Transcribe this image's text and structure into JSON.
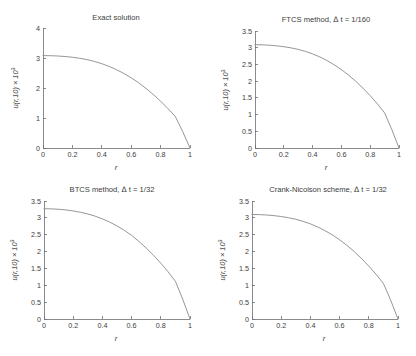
{
  "figure": {
    "background": "#ffffff",
    "axis_color": "#6e6e6e",
    "curve_color": "#8a8a8a",
    "text_color": "#3d3d3d"
  },
  "chart_data": [
    {
      "id": "exact",
      "type": "line",
      "title": "Exact solution",
      "xlabel": "r",
      "ylabel": "u(r,10) × 10³",
      "ylabel_main": "u(r,10) × 10",
      "ylabel_exp": "3",
      "xlim": [
        0,
        1
      ],
      "ylim": [
        0,
        4
      ],
      "xticks": [
        0,
        0.2,
        0.4,
        0.6,
        0.8,
        1
      ],
      "xticklabels": [
        "0",
        "0.2",
        "0.4",
        "0.6",
        "0.8",
        "1"
      ],
      "yticks": [
        0,
        1,
        2,
        3,
        4
      ],
      "yticklabels": [
        "0",
        "1",
        "2",
        "3",
        "4"
      ],
      "grid": false,
      "legend": false,
      "x": [
        0,
        0.05,
        0.1,
        0.15,
        0.2,
        0.25,
        0.3,
        0.35,
        0.4,
        0.45,
        0.5,
        0.55,
        0.6,
        0.65,
        0.7,
        0.75,
        0.8,
        0.85,
        0.9,
        0.95,
        1
      ],
      "y": [
        3.08,
        3.077,
        3.067,
        3.05,
        3.025,
        2.99,
        2.945,
        2.885,
        2.81,
        2.72,
        2.61,
        2.485,
        2.34,
        2.175,
        1.99,
        1.785,
        1.56,
        1.315,
        1.05,
        0.55,
        0
      ]
    },
    {
      "id": "ftcs",
      "type": "line",
      "title": "FTCS method, Δ t = 1/160",
      "title_prefix": "FTCS method, ",
      "title_delta": "Δ",
      "title_suffix": " t = 1/160",
      "xlabel": "r",
      "ylabel": "u(r,10) × 10³",
      "ylabel_main": "u(r,10) × 10",
      "ylabel_exp": "3",
      "xlim": [
        0,
        1
      ],
      "ylim": [
        0,
        3.5
      ],
      "xticks": [
        0,
        0.2,
        0.4,
        0.6,
        0.8,
        1
      ],
      "xticklabels": [
        "0",
        "0.2",
        "0.4",
        "0.6",
        "0.8",
        "1"
      ],
      "yticks": [
        0,
        0.5,
        1,
        1.5,
        2,
        2.5,
        3,
        3.5
      ],
      "yticklabels": [
        "0",
        "0.5",
        "1",
        "1.5",
        "2",
        "2.5",
        "3",
        "3.5"
      ],
      "grid": false,
      "legend": false,
      "x": [
        0,
        0.05,
        0.1,
        0.15,
        0.2,
        0.25,
        0.3,
        0.35,
        0.4,
        0.45,
        0.5,
        0.55,
        0.6,
        0.65,
        0.7,
        0.75,
        0.8,
        0.85,
        0.9,
        0.95,
        1
      ],
      "y": [
        3.09,
        3.086,
        3.075,
        3.057,
        3.03,
        2.995,
        2.95,
        2.89,
        2.815,
        2.725,
        2.615,
        2.49,
        2.345,
        2.18,
        1.995,
        1.79,
        1.565,
        1.32,
        1.05,
        0.55,
        0
      ]
    },
    {
      "id": "btcs",
      "type": "line",
      "title": "BTCS method,  Δ t = 1/32",
      "title_prefix": "BTCS method,  ",
      "title_delta": "Δ",
      "title_suffix": " t = 1/32",
      "xlabel": "r",
      "ylabel": "u(r,10) × 10³",
      "ylabel_main": "u(r,10) × 10",
      "ylabel_exp": "3",
      "xlim": [
        0,
        1
      ],
      "ylim": [
        0,
        3.5
      ],
      "xticks": [
        0,
        0.2,
        0.4,
        0.6,
        0.8,
        1
      ],
      "xticklabels": [
        "0",
        "0.2",
        "0.4",
        "0.6",
        "0.8",
        "1"
      ],
      "yticks": [
        0,
        0.5,
        1,
        1.5,
        2,
        2.5,
        3,
        3.5
      ],
      "yticklabels": [
        "0",
        "0.5",
        "1",
        "1.5",
        "2",
        "2.5",
        "3",
        "3.5"
      ],
      "grid": false,
      "legend": false,
      "x": [
        0,
        0.05,
        0.1,
        0.15,
        0.2,
        0.25,
        0.3,
        0.35,
        0.4,
        0.45,
        0.5,
        0.55,
        0.6,
        0.65,
        0.7,
        0.75,
        0.8,
        0.85,
        0.9,
        0.95,
        1
      ],
      "y": [
        3.27,
        3.266,
        3.255,
        3.235,
        3.205,
        3.165,
        3.115,
        3.05,
        2.97,
        2.875,
        2.76,
        2.63,
        2.48,
        2.3,
        2.105,
        1.89,
        1.655,
        1.4,
        1.12,
        0.59,
        0
      ]
    },
    {
      "id": "crank-nicolson",
      "type": "line",
      "title": "Crank-Nicolson scheme,  Δ t = 1/32",
      "title_prefix": "Crank-Nicolson scheme,  ",
      "title_delta": "Δ",
      "title_suffix": " t = 1/32",
      "xlabel": "r",
      "ylabel": "u(r,10) × 10³",
      "ylabel_main": "u(r,10) × 10",
      "ylabel_exp": "3",
      "xlim": [
        0,
        1
      ],
      "ylim": [
        0,
        3.5
      ],
      "xticks": [
        0,
        0.2,
        0.4,
        0.6,
        0.8,
        1
      ],
      "xticklabels": [
        "0",
        "0.2",
        "0.4",
        "0.6",
        "0.8",
        "1"
      ],
      "yticks": [
        0,
        0.5,
        1,
        1.5,
        2,
        2.5,
        3,
        3.5
      ],
      "yticklabels": [
        "0",
        "0.5",
        "1",
        "1.5",
        "2",
        "2.5",
        "3",
        "3.5"
      ],
      "grid": false,
      "legend": false,
      "x": [
        0,
        0.05,
        0.1,
        0.15,
        0.2,
        0.25,
        0.3,
        0.35,
        0.4,
        0.45,
        0.5,
        0.55,
        0.6,
        0.65,
        0.7,
        0.75,
        0.8,
        0.85,
        0.9,
        0.95,
        1
      ],
      "y": [
        3.1,
        3.096,
        3.085,
        3.066,
        3.04,
        3.003,
        2.957,
        2.897,
        2.822,
        2.73,
        2.62,
        2.495,
        2.35,
        2.185,
        2.0,
        1.795,
        1.57,
        1.325,
        1.055,
        0.555,
        0
      ]
    }
  ]
}
